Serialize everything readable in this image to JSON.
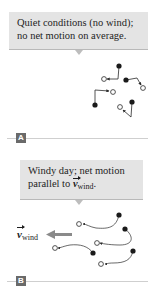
{
  "panels": [
    {
      "label": "A",
      "callout": {
        "line1": "Quiet conditions (no wind);",
        "line2": "no net motion on average."
      },
      "description": "random walk paths, filled dot = start, open circle = end"
    },
    {
      "label": "B",
      "callout": {
        "line1": "Windy day; net motion",
        "line2_prefix": "parallel to ",
        "line2_vector": "v",
        "line2_subscript": "wind",
        "line2_suffix": "."
      },
      "wind_label": {
        "vector": "v",
        "subscript": "wind"
      }
    }
  ],
  "colors": {
    "callout_bg": "#e4e4e4",
    "callout_border": "#b9b9b9",
    "label_badge": "#6a6a6a",
    "wind_arrow": "#8a8a8a",
    "path_stroke": "#2a2a2a",
    "rule": "#cfcfcf"
  },
  "icons": {
    "start_marker": "filled-circle",
    "end_marker": "open-circle",
    "wind_arrow": "left-arrow"
  }
}
